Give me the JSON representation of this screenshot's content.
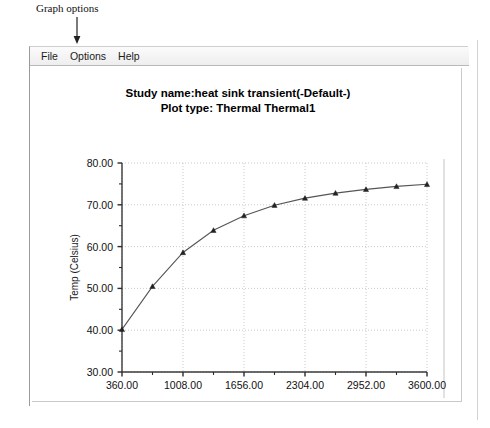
{
  "annotation": {
    "label": "Graph options",
    "arrow_icon": "down-arrow-icon"
  },
  "window": {
    "menubar": {
      "items": [
        {
          "label": "File",
          "name": "menu-file"
        },
        {
          "label": "Options",
          "name": "menu-options"
        },
        {
          "label": "Help",
          "name": "menu-help"
        }
      ]
    }
  },
  "chart_data": {
    "type": "line",
    "title": "Study name:heat sink transient(-Default-)",
    "subtitle": "Plot type: Thermal Thermal1",
    "title_lines": [
      "Study name:heat sink transient(-Default-)",
      "Plot type: Thermal Thermal1"
    ],
    "xlabel": "Time (sec)",
    "ylabel": "Temp (Celsius)",
    "xlim": [
      360.0,
      3600.0
    ],
    "ylim": [
      30.0,
      80.0
    ],
    "xticks": [
      360.0,
      1008.0,
      1656.0,
      2304.0,
      2952.0,
      3600.0
    ],
    "xtick_labels": [
      "360.00",
      "1008.00",
      "1656.00",
      "2304.00",
      "2952.00",
      "3600.00"
    ],
    "yticks": [
      30.0,
      40.0,
      50.0,
      60.0,
      70.0,
      80.0
    ],
    "ytick_labels": [
      "30.00",
      "40.00",
      "50.00",
      "60.00",
      "70.00",
      "80.00"
    ],
    "minor_x_divisions": 2,
    "minor_y_divisions": 2,
    "grid": true,
    "grid_style": "dotted",
    "legend": null,
    "marker": "triangle",
    "line_color": "#555555",
    "marker_color": "#222222",
    "series": [
      {
        "name": "Thermal1",
        "x": [
          360,
          684,
          1008,
          1332,
          1656,
          1980,
          2304,
          2628,
          2952,
          3276,
          3600
        ],
        "y": [
          40.2,
          50.5,
          58.6,
          63.9,
          67.4,
          69.9,
          71.6,
          72.8,
          73.7,
          74.4,
          74.9
        ]
      }
    ]
  }
}
